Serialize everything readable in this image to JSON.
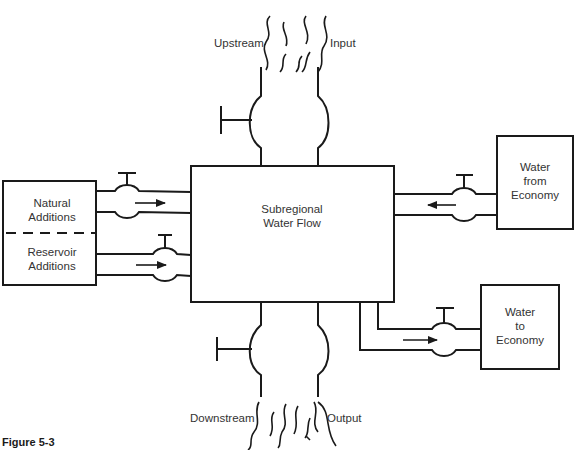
{
  "figure": {
    "caption": "Figure 5-3",
    "central_node": {
      "line1": "Subregional",
      "line2": "Water Flow"
    },
    "upstream": {
      "left_label": "Upstream",
      "right_label": "Input"
    },
    "downstream": {
      "left_label": "Downstream",
      "right_label": "Output"
    },
    "left_box": {
      "top": {
        "line1": "Natural",
        "line2": "Additions"
      },
      "bottom": {
        "line1": "Reservoir",
        "line2": "Additions"
      }
    },
    "right_top_box": {
      "line1": "Water",
      "line2": "from",
      "line3": "Economy"
    },
    "right_bottom_box": {
      "line1": "Water",
      "line2": "to",
      "line3": "Economy"
    },
    "flows": [
      {
        "from": "Natural Additions",
        "to": "Subregional Water Flow",
        "direction": "right"
      },
      {
        "from": "Reservoir Additions",
        "to": "Subregional Water Flow",
        "direction": "right"
      },
      {
        "from": "Water from Economy",
        "to": "Subregional Water Flow",
        "direction": "left"
      },
      {
        "from": "Subregional Water Flow",
        "to": "Water to Economy",
        "direction": "right"
      },
      {
        "from": "Upstream Input",
        "to": "Subregional Water Flow",
        "direction": "down"
      },
      {
        "from": "Subregional Water Flow",
        "to": "Downstream Output",
        "direction": "down"
      }
    ]
  }
}
